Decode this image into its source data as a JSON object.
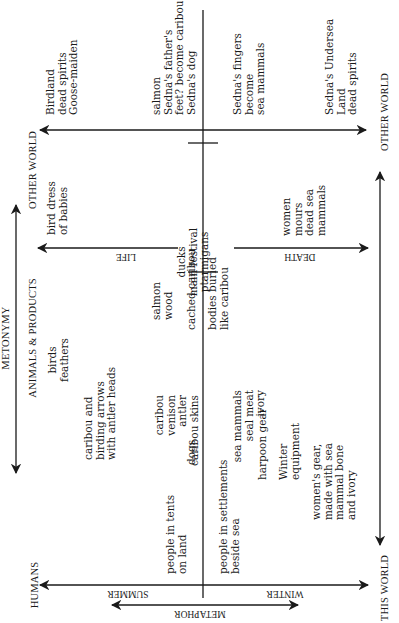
{
  "axes": {
    "other_world_left": "OTHER WORLD",
    "other_world_right": "OTHER WORLD",
    "this_world": "THIS WORLD",
    "humans": "HUMANS",
    "animals_products": "ANIMALS & PRODUCTS",
    "metonymy": "METONYMY",
    "metaphor": "METAPHOR",
    "summer": "SUMMER",
    "winter": "WINTER",
    "life": "LIFE",
    "death": "DEATH"
  },
  "other_world_summer": {
    "birdland": [
      "Birdland",
      "dead spirits",
      "Goose-maiden"
    ],
    "salmon": [
      "salmon",
      "Sedna's father's",
      "feet? become caribou",
      "Sedna's dog"
    ]
  },
  "other_world_winter": {
    "fingers": [
      "Sedna's fingers",
      "become",
      "sea mammals"
    ],
    "undersea": [
      "Sedna's Undersea",
      "Land",
      "dead spirits"
    ]
  },
  "middle": {
    "bird_dress": [
      "bird dress",
      "of babies"
    ],
    "festival": [
      "ducks",
      "main festival",
      "ptarmigans"
    ],
    "women_mourn": [
      "women",
      "mours",
      "dead sea",
      "mammals"
    ],
    "salmon_wood": [
      "salmon",
      "wood"
    ],
    "cached_caribou": "cached caribou",
    "bodies_buried": [
      "bodies buried",
      "like caribou"
    ]
  },
  "this_world_summer": {
    "birds": [
      "birds",
      "feathers"
    ],
    "caribou": [
      "caribou",
      "venison",
      "antler",
      "caribou skins"
    ],
    "arrows": [
      "caribou and",
      "birding arrows",
      "with antler heads"
    ],
    "dogs": "dogs",
    "tents": [
      "people in tents",
      "on land"
    ]
  },
  "this_world_winter": {
    "sea_mammals": [
      "sea mammals",
      "seal meat",
      "ivory"
    ],
    "harpoon": "harpoon gear",
    "winter_equipment": [
      "Winter",
      "equipment"
    ],
    "womens_gear": [
      "women's gear,",
      "made with sea",
      "mammal bone",
      "and ivory"
    ],
    "settlements": [
      "people in settlements",
      "beside sea"
    ]
  }
}
